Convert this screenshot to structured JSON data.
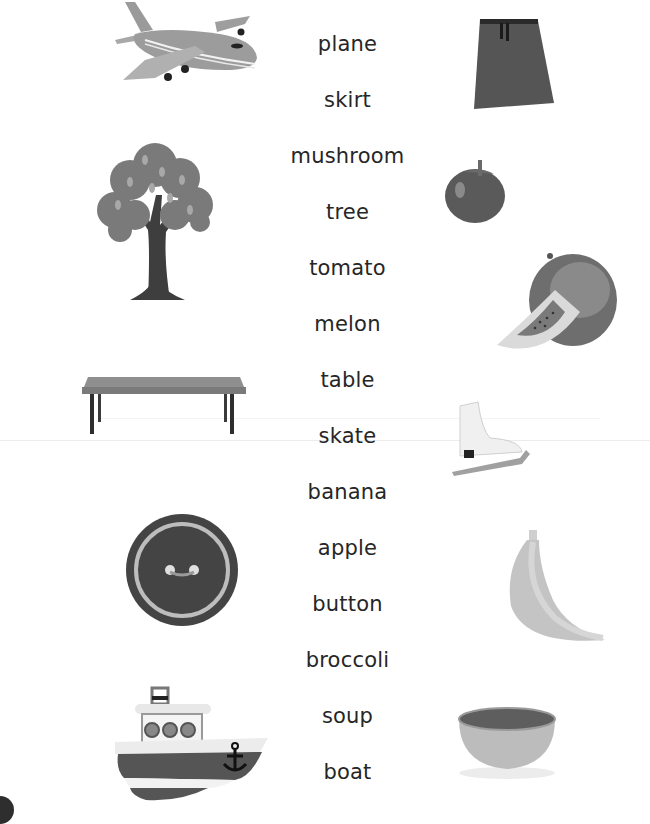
{
  "worksheet": {
    "words": [
      "plane",
      "skirt",
      "mushroom",
      "tree",
      "tomato",
      "melon",
      "table",
      "skate",
      "banana",
      "apple",
      "button",
      "broccoli",
      "soup",
      "boat"
    ],
    "left_pictures": [
      {
        "name": "plane-picture",
        "label": "plane"
      },
      {
        "name": "tree-picture",
        "label": "tree"
      },
      {
        "name": "table-picture",
        "label": "table"
      },
      {
        "name": "button-picture",
        "label": "button"
      },
      {
        "name": "boat-picture",
        "label": "boat"
      }
    ],
    "right_pictures": [
      {
        "name": "skirt-picture",
        "label": "skirt"
      },
      {
        "name": "tomato-picture",
        "label": "tomato"
      },
      {
        "name": "melon-picture",
        "label": "melon"
      },
      {
        "name": "skate-picture",
        "label": "skate"
      },
      {
        "name": "banana-picture",
        "label": "banana"
      },
      {
        "name": "soup-picture",
        "label": "soup"
      }
    ]
  }
}
